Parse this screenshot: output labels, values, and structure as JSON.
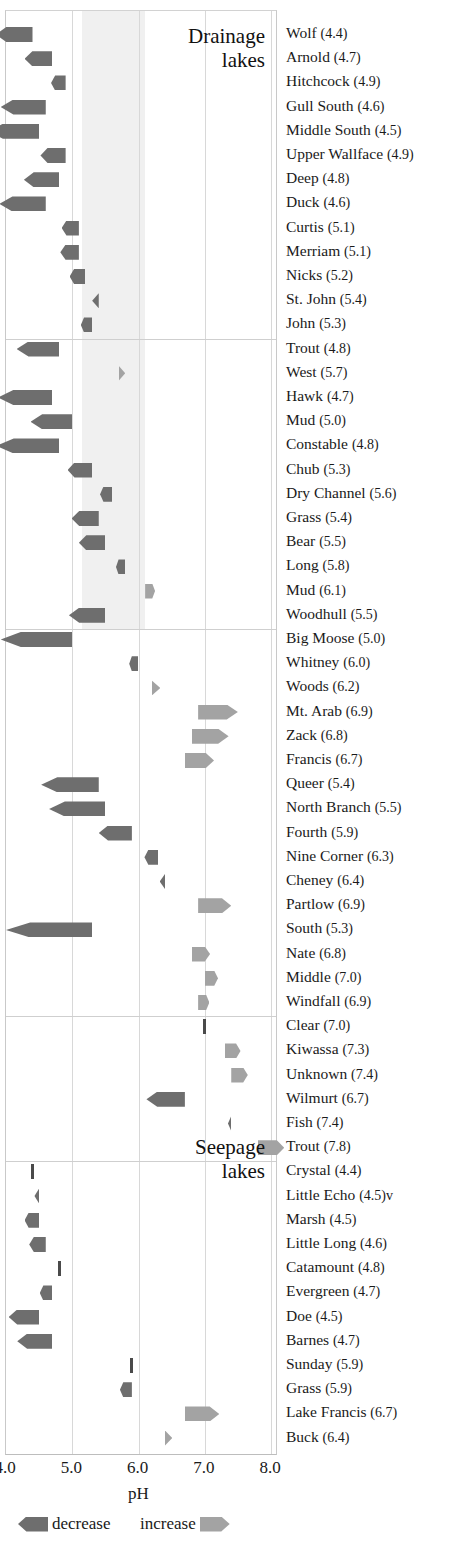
{
  "chart_data": {
    "type": "bar",
    "title": "",
    "xlabel": "pH",
    "ylabel": "",
    "xlim": [
      4.0,
      8.0
    ],
    "grid": true,
    "orientation": "horizontal-diverging",
    "tick_labels": [
      "4.0",
      "5.0",
      "6.0",
      "7.0",
      "8.0"
    ],
    "tick_values": [
      4.0,
      5.0,
      6.0,
      7.0,
      8.0
    ],
    "legend": {
      "position": "below-axis",
      "entries": [
        {
          "label": "decrease",
          "color": "#6e6e6e",
          "direction": "left"
        },
        {
          "label": "increase",
          "color": "#a3a3a3",
          "direction": "right"
        }
      ]
    },
    "shaded_band": {
      "from": 5.15,
      "to": 6.1,
      "color": "#f0f0f0"
    },
    "groups": [
      {
        "name": "Drainage lakes",
        "title_lines": [
          "Drainage",
          "lakes"
        ],
        "subgroups": [
          {
            "rows": [
              {
                "lake": "Wolf",
                "ph": 4.4,
                "change": -0.55,
                "direction": "decrease"
              },
              {
                "lake": "Arnold",
                "ph": 4.7,
                "change": -0.42,
                "direction": "decrease"
              },
              {
                "lake": "Hitchcock",
                "ph": 4.9,
                "change": -0.22,
                "direction": "decrease"
              },
              {
                "lake": "Gull South",
                "ph": 4.6,
                "change": -0.68,
                "direction": "decrease"
              },
              {
                "lake": "Middle South",
                "ph": 4.5,
                "change": -0.76,
                "direction": "decrease"
              },
              {
                "lake": "Upper Wallface",
                "ph": 4.9,
                "change": -0.38,
                "direction": "decrease"
              },
              {
                "lake": "Deep",
                "ph": 4.8,
                "change": -0.53,
                "direction": "decrease"
              },
              {
                "lake": "Duck",
                "ph": 4.6,
                "change": -0.7,
                "direction": "decrease"
              },
              {
                "lake": "Curtis",
                "ph": 5.1,
                "change": -0.26,
                "direction": "decrease"
              },
              {
                "lake": "Merriam",
                "ph": 5.1,
                "change": -0.28,
                "direction": "decrease"
              },
              {
                "lake": "Nicks",
                "ph": 5.2,
                "change": -0.24,
                "direction": "decrease"
              },
              {
                "lake": "St. John",
                "ph": 5.4,
                "change": -0.1,
                "direction": "decrease"
              },
              {
                "lake": "John",
                "ph": 5.3,
                "change": -0.17,
                "direction": "decrease"
              }
            ]
          },
          {
            "rows": [
              {
                "lake": "Trout",
                "ph": 4.8,
                "change": -0.64,
                "direction": "decrease"
              },
              {
                "lake": "West",
                "ph": 5.7,
                "change": 0.1,
                "direction": "increase"
              },
              {
                "lake": "Hawk",
                "ph": 4.7,
                "change": -0.82,
                "direction": "decrease"
              },
              {
                "lake": "Mud",
                "ph": 5.0,
                "change": -0.63,
                "direction": "decrease"
              },
              {
                "lake": "Constable",
                "ph": 4.8,
                "change": -0.95,
                "direction": "decrease"
              },
              {
                "lake": "Chub",
                "ph": 5.3,
                "change": -0.37,
                "direction": "decrease"
              },
              {
                "lake": "Dry Channel",
                "ph": 5.6,
                "change": -0.18,
                "direction": "decrease"
              },
              {
                "lake": "Grass",
                "ph": 5.4,
                "change": -0.41,
                "direction": "decrease"
              },
              {
                "lake": "Bear",
                "ph": 5.5,
                "change": -0.4,
                "direction": "decrease"
              },
              {
                "lake": "Long",
                "ph": 5.8,
                "change": -0.14,
                "direction": "decrease"
              },
              {
                "lake": "Mud",
                "ph": 6.1,
                "change": 0.15,
                "direction": "increase"
              },
              {
                "lake": "Woodhull",
                "ph": 5.5,
                "change": -0.55,
                "direction": "decrease"
              }
            ]
          },
          {
            "rows": [
              {
                "lake": "Big Moose",
                "ph": 5.0,
                "change": -1.08,
                "direction": "decrease"
              },
              {
                "lake": "Whitney",
                "ph": 6.0,
                "change": -0.14,
                "direction": "decrease"
              },
              {
                "lake": "Woods",
                "ph": 6.2,
                "change": 0.13,
                "direction": "increase"
              },
              {
                "lake": "Mt. Arab",
                "ph": 6.9,
                "change": 0.6,
                "direction": "increase"
              },
              {
                "lake": "Zack",
                "ph": 6.8,
                "change": 0.56,
                "direction": "increase"
              },
              {
                "lake": "Francis",
                "ph": 6.7,
                "change": 0.44,
                "direction": "increase"
              },
              {
                "lake": "Queer",
                "ph": 5.4,
                "change": -0.87,
                "direction": "decrease"
              },
              {
                "lake": "North Branch",
                "ph": 5.5,
                "change": -0.85,
                "direction": "decrease"
              },
              {
                "lake": "Fourth",
                "ph": 5.9,
                "change": -0.5,
                "direction": "decrease"
              },
              {
                "lake": "Nine Corner",
                "ph": 6.3,
                "change": -0.21,
                "direction": "decrease"
              },
              {
                "lake": "Cheney",
                "ph": 6.4,
                "change": -0.08,
                "direction": "decrease"
              },
              {
                "lake": "Partlow",
                "ph": 6.9,
                "change": 0.5,
                "direction": "increase"
              },
              {
                "lake": "South",
                "ph": 5.3,
                "change": -1.3,
                "direction": "decrease"
              },
              {
                "lake": "Nate",
                "ph": 6.8,
                "change": 0.28,
                "direction": "increase"
              },
              {
                "lake": "Middle",
                "ph": 7.0,
                "change": 0.2,
                "direction": "increase"
              },
              {
                "lake": "Windfall",
                "ph": 6.9,
                "change": 0.17,
                "direction": "increase"
              }
            ]
          },
          {
            "rows": [
              {
                "lake": "Clear",
                "ph": 7.0,
                "change": 0.02,
                "direction": "none"
              },
              {
                "lake": "Kiwassa",
                "ph": 7.3,
                "change": 0.24,
                "direction": "increase"
              },
              {
                "lake": "Unknown",
                "ph": 7.4,
                "change": 0.25,
                "direction": "increase"
              },
              {
                "lake": "Wilmurt",
                "ph": 6.7,
                "change": -0.58,
                "direction": "decrease"
              },
              {
                "lake": "Fish",
                "ph": 7.4,
                "change": -0.05,
                "direction": "decrease"
              },
              {
                "lake": "Trout",
                "ph": 7.8,
                "change": 0.4,
                "direction": "increase"
              }
            ]
          }
        ]
      },
      {
        "name": "Seepage lakes",
        "title_lines": [
          "Seepage",
          "lakes"
        ],
        "subgroups": [
          {
            "rows": [
              {
                "lake": "Crystal",
                "ph": 4.4,
                "change": 0.02,
                "direction": "none"
              },
              {
                "lake": "Little Echo",
                "ph": "4.5)v",
                "ph_value": 4.5,
                "change": -0.07,
                "direction": "decrease"
              },
              {
                "lake": "Marsh",
                "ph": 4.5,
                "change": -0.22,
                "direction": "decrease"
              },
              {
                "lake": "Little Long",
                "ph": 4.6,
                "change": -0.25,
                "direction": "decrease"
              },
              {
                "lake": "Catamount",
                "ph": 4.8,
                "change": 0.02,
                "direction": "none"
              },
              {
                "lake": "Evergreen",
                "ph": 4.7,
                "change": -0.19,
                "direction": "decrease"
              },
              {
                "lake": "Doe",
                "ph": 4.5,
                "change": -0.46,
                "direction": "decrease"
              },
              {
                "lake": "Barnes",
                "ph": 4.7,
                "change": -0.53,
                "direction": "decrease"
              },
              {
                "lake": "Sunday",
                "ph": 5.9,
                "change": 0.02,
                "direction": "none"
              },
              {
                "lake": "Grass",
                "ph": 5.9,
                "change": -0.18,
                "direction": "decrease"
              },
              {
                "lake": "Lake Francis",
                "ph": 6.7,
                "change": 0.52,
                "direction": "increase"
              },
              {
                "lake": "Buck",
                "ph": 6.4,
                "change": 0.11,
                "direction": "increase"
              }
            ]
          }
        ]
      }
    ]
  },
  "axis": {
    "pH_label": "pH",
    "ticks": [
      "4.0",
      "5.0",
      "6.0",
      "7.0",
      "8.0"
    ]
  },
  "legend": {
    "decrease_label": "decrease",
    "increase_label": "increase"
  },
  "titles": {
    "drainage_line1": "Drainage",
    "drainage_line2": "lakes",
    "seepage_line1": "Seepage",
    "seepage_line2": "lakes"
  },
  "colors": {
    "decrease": "#6e6e6e",
    "increase": "#a3a3a3",
    "band": "#f0f0f0",
    "grid": "#d8d8d8"
  }
}
